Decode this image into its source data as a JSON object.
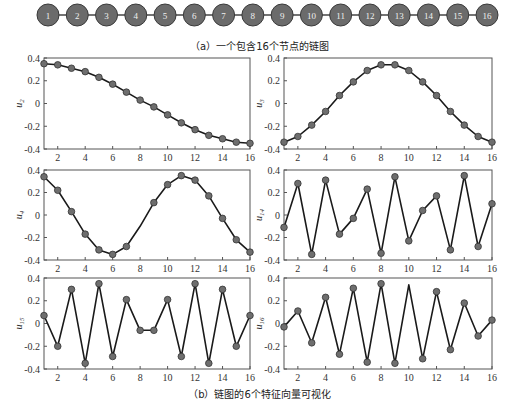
{
  "figure": {
    "caption_a": "（a）一个包含16个节点的链图",
    "caption_b": "（b）链图的6个特征向量可视化"
  },
  "graph": {
    "type": "chain",
    "node_labels": [
      "1",
      "2",
      "3",
      "4",
      "5",
      "6",
      "7",
      "8",
      "9",
      "10",
      "11",
      "12",
      "13",
      "14",
      "15",
      "16"
    ],
    "node_color": "#6b6b6b",
    "edge_color": "#444444"
  },
  "style": {
    "marker_color": "#6e6e6e",
    "line_color": "#1a1a1a",
    "axis_color": "#555555"
  },
  "chart_data": [
    {
      "type": "line",
      "ylabel": "u2",
      "x": [
        1,
        2,
        3,
        4,
        5,
        6,
        7,
        8,
        9,
        10,
        11,
        12,
        13,
        14,
        15,
        16
      ],
      "values": [
        0.35,
        0.34,
        0.31,
        0.28,
        0.23,
        0.17,
        0.1,
        0.03,
        -0.03,
        -0.1,
        -0.17,
        -0.23,
        -0.28,
        -0.31,
        -0.34,
        -0.35
      ],
      "markers": [
        true,
        true,
        true,
        true,
        true,
        true,
        true,
        true,
        true,
        true,
        true,
        true,
        true,
        true,
        true,
        true
      ],
      "xticks": [
        2,
        4,
        6,
        8,
        10,
        12,
        14,
        16
      ],
      "yticks": [
        0.4,
        0.2,
        0,
        -0.2,
        -0.4
      ],
      "xlim": [
        1,
        16
      ],
      "ylim": [
        -0.4,
        0.4
      ]
    },
    {
      "type": "line",
      "ylabel": "u3",
      "x": [
        1,
        2,
        3,
        4,
        5,
        6,
        7,
        8,
        9,
        10,
        11,
        12,
        13,
        14,
        15,
        16
      ],
      "values": [
        -0.34,
        -0.29,
        -0.19,
        -0.07,
        0.07,
        0.19,
        0.29,
        0.34,
        0.34,
        0.29,
        0.19,
        0.07,
        -0.07,
        -0.19,
        -0.29,
        -0.34
      ],
      "markers": [
        true,
        true,
        true,
        true,
        true,
        true,
        true,
        true,
        true,
        true,
        true,
        true,
        true,
        true,
        true,
        true
      ],
      "xticks": [
        2,
        4,
        6,
        8,
        10,
        12,
        14,
        16
      ],
      "yticks": [
        0.4,
        0.2,
        0,
        -0.2,
        -0.4
      ],
      "xlim": [
        1,
        16
      ],
      "ylim": [
        -0.4,
        0.4
      ]
    },
    {
      "type": "line",
      "ylabel": "u4",
      "x": [
        1,
        2,
        3,
        4,
        5,
        6,
        7,
        8,
        9,
        10,
        11,
        12,
        13,
        14,
        15,
        16
      ],
      "values": [
        0.34,
        0.22,
        0.03,
        -0.17,
        -0.31,
        -0.35,
        -0.28,
        -0.1,
        0.11,
        0.27,
        0.35,
        0.31,
        0.17,
        -0.03,
        -0.22,
        -0.33
      ],
      "markers": [
        true,
        true,
        true,
        true,
        true,
        true,
        true,
        false,
        true,
        true,
        true,
        true,
        true,
        true,
        true,
        true
      ],
      "xticks": [
        2,
        4,
        6,
        8,
        10,
        12,
        14,
        16
      ],
      "yticks": [
        0.4,
        0.2,
        0,
        -0.2,
        -0.4
      ],
      "xlim": [
        1,
        16
      ],
      "ylim": [
        -0.4,
        0.4
      ]
    },
    {
      "type": "line",
      "ylabel": "u14",
      "x": [
        1,
        2,
        3,
        4,
        5,
        6,
        7,
        8,
        9,
        10,
        11,
        12,
        13,
        14,
        15,
        16
      ],
      "values": [
        -0.11,
        0.28,
        -0.35,
        0.31,
        -0.17,
        -0.03,
        0.23,
        -0.34,
        0.34,
        -0.23,
        0.04,
        0.17,
        -0.31,
        0.35,
        -0.28,
        0.1
      ],
      "markers": [
        true,
        true,
        true,
        true,
        true,
        true,
        true,
        true,
        true,
        true,
        true,
        true,
        true,
        true,
        true,
        true
      ],
      "xticks": [
        2,
        4,
        6,
        8,
        10,
        12,
        14,
        16
      ],
      "yticks": [
        0.4,
        0.2,
        0,
        -0.2,
        -0.4
      ],
      "xlim": [
        1,
        16
      ],
      "ylim": [
        -0.4,
        0.4
      ]
    },
    {
      "type": "line",
      "ylabel": "u15",
      "x": [
        1,
        2,
        3,
        4,
        5,
        6,
        7,
        8,
        9,
        10,
        11,
        12,
        13,
        14,
        15,
        16
      ],
      "values": [
        0.07,
        -0.2,
        0.3,
        -0.35,
        0.35,
        -0.29,
        0.21,
        -0.06,
        -0.06,
        0.21,
        -0.29,
        0.35,
        -0.35,
        0.3,
        -0.2,
        0.07
      ],
      "markers": [
        true,
        true,
        true,
        true,
        true,
        true,
        true,
        true,
        true,
        true,
        true,
        true,
        true,
        true,
        true,
        true
      ],
      "xticks": [
        2,
        4,
        6,
        8,
        10,
        12,
        14,
        16
      ],
      "yticks": [
        0.4,
        0.2,
        0,
        -0.2,
        -0.4
      ],
      "xlim": [
        1,
        16
      ],
      "ylim": [
        -0.4,
        0.4
      ]
    },
    {
      "type": "line",
      "ylabel": "u16",
      "x": [
        1,
        2,
        3,
        4,
        5,
        6,
        7,
        8,
        9,
        10,
        11,
        12,
        13,
        14,
        15,
        16
      ],
      "values": [
        -0.03,
        0.11,
        -0.17,
        0.23,
        -0.27,
        0.31,
        -0.34,
        0.35,
        -0.35,
        0.34,
        -0.31,
        0.28,
        -0.23,
        0.18,
        -0.11,
        0.03
      ],
      "markers": [
        true,
        true,
        true,
        true,
        true,
        true,
        true,
        true,
        true,
        false,
        true,
        true,
        true,
        true,
        true,
        true
      ],
      "xticks": [
        2,
        4,
        6,
        8,
        10,
        12,
        14,
        16
      ],
      "yticks": [
        0.4,
        0.2,
        0,
        -0.2,
        -0.4
      ],
      "xlim": [
        1,
        16
      ],
      "ylim": [
        -0.4,
        0.4
      ]
    }
  ]
}
